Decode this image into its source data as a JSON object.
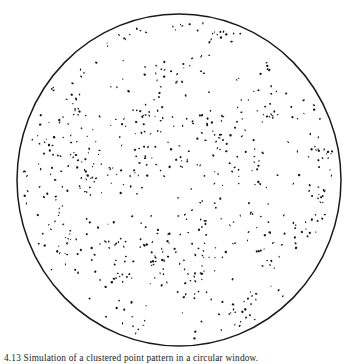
{
  "figure": {
    "background_color": "#ffffff",
    "ink_color": "#141414",
    "boundary": {
      "shape": "circle",
      "center_x": 179,
      "center_y": 180,
      "radius_x": 162,
      "radius_y": 166,
      "stroke_color": "#1a1a1a",
      "stroke_width": 1.5,
      "fill": "none"
    }
  },
  "caption": {
    "number": "4.13",
    "text": "Simulation of a clustered point pattern in a circular window.",
    "full": "4.13 Simulation of a clustered point pattern in a circular window."
  },
  "chart_data": {
    "type": "scatter",
    "title": "",
    "subtitle": "",
    "xlabel": "",
    "ylabel": "",
    "xlim": [
      -1,
      1
    ],
    "ylim": [
      -1,
      1
    ],
    "grid": false,
    "legend": null,
    "axes_visible": false,
    "tick_labels_x": [],
    "tick_labels_y": [],
    "annotations": [],
    "window": {
      "type": "circle",
      "center": [
        0,
        0
      ],
      "radius": 1
    },
    "marker": {
      "shape": "point",
      "color": "#141414",
      "size_px": 1.6,
      "size_range_px": [
        1.0,
        2.6
      ]
    },
    "n_points": 648,
    "cluster_seed": 20240411,
    "n_parents": 86,
    "offspring_per_parent_mean": 6.2,
    "cluster_radius": 0.085,
    "background_fraction": 0.18
  }
}
